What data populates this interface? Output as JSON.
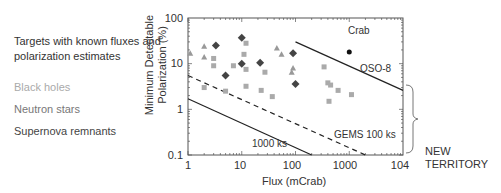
{
  "legend": {
    "title": "Targets with known fluxes and polarization estimates",
    "items": [
      {
        "label": "Black holes",
        "color": "#aaaaaa",
        "marker": "triangle"
      },
      {
        "label": "Neutron stars",
        "color": "#999999",
        "marker": "square"
      },
      {
        "label": "Supernova remnants",
        "color": "#444444",
        "marker": "diamond"
      }
    ]
  },
  "chart_data": {
    "type": "scatter",
    "title": "",
    "xlabel": "Flux (mCrab)",
    "ylabel": "Minimum Detectable Polarization (%)",
    "xscale": "log",
    "yscale": "log",
    "xlim": [
      1,
      10000
    ],
    "ylim": [
      0.1,
      100
    ],
    "x_ticks": [
      "1",
      "10",
      "100",
      "1000",
      "104"
    ],
    "y_ticks": [
      "0.1",
      "1",
      "10",
      "100"
    ],
    "series": [
      {
        "name": "Black holes",
        "marker": "triangle",
        "color": "#999999",
        "points": [
          [
            1.1,
            17
          ],
          [
            2,
            24
          ],
          [
            2,
            14
          ],
          [
            45,
            22
          ],
          [
            55,
            16
          ],
          [
            90,
            8
          ],
          [
            85,
            6.5
          ]
        ]
      },
      {
        "name": "Neutron stars",
        "marker": "square",
        "color": "#aaaaaa",
        "points": [
          [
            3,
            13
          ],
          [
            3,
            9
          ],
          [
            2,
            3
          ],
          [
            5,
            2.5
          ],
          [
            7,
            9
          ],
          [
            11,
            16
          ],
          [
            12,
            28
          ],
          [
            12,
            7.5
          ],
          [
            12,
            3.2
          ],
          [
            23,
            2.6
          ],
          [
            27,
            6.5
          ],
          [
            37,
            1.9
          ],
          [
            340,
            8.5
          ],
          [
            400,
            3.8
          ],
          [
            450,
            3.4
          ],
          [
            420,
            1.5
          ],
          [
            620,
            2.6
          ],
          [
            1100,
            2.1
          ]
        ]
      },
      {
        "name": "Supernova remnants",
        "marker": "diamond",
        "color": "#444444",
        "points": [
          [
            3.3,
            25
          ],
          [
            10,
            37
          ],
          [
            10,
            10
          ],
          [
            5,
            5.5
          ],
          [
            22,
            10.5
          ],
          [
            90,
            17
          ],
          [
            100,
            3.6
          ]
        ]
      },
      {
        "name": "Crab",
        "marker": "circle",
        "color": "#111111",
        "points": [
          [
            1000,
            18
          ]
        ]
      }
    ],
    "lines": [
      {
        "name": "OSO-8",
        "style": "solid",
        "from": [
          100,
          30
        ],
        "to": [
          10000,
          2.6
        ]
      },
      {
        "name": "GEMS 100 ks",
        "style": "dashed",
        "from": [
          1,
          5.5
        ],
        "to": [
          2000,
          0.1
        ]
      },
      {
        "name": "1000 ks",
        "style": "solid",
        "from": [
          1,
          1.7
        ],
        "to": [
          200,
          0.1
        ]
      }
    ],
    "annotations": [
      "Crab",
      "OSO-8",
      "GEMS 100 ks",
      "1000 ks",
      "NEW TERRITORY"
    ],
    "grid": false,
    "legend_position": "left"
  },
  "annotations": {
    "crab": "Crab",
    "oso8": "OSO-8",
    "gems": "GEMS 100 ks",
    "ks1000": "1000 ks",
    "new_territory": "NEW TERRITORY"
  },
  "axes": {
    "xlabel": "Flux (mCrab)",
    "ylabel": "Minimum Detectable Polarization (%)",
    "x_ticks": [
      "1",
      "10",
      "100",
      "1000",
      "104"
    ],
    "y_ticks": [
      "0.1",
      "1",
      "10",
      "100"
    ]
  }
}
